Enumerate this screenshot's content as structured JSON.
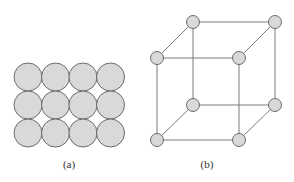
{
  "figure_a": {
    "label": "(a)",
    "label_pos": [
      69,
      168
    ],
    "grid": {
      "cols": 4,
      "rows": 3,
      "x0": 28,
      "y0": 77,
      "dx": 27.5,
      "dy": 28,
      "r": 14
    },
    "fill": "#d9d9d9",
    "stroke": "#6b6b6b"
  },
  "figure_b": {
    "label": "(b)",
    "label_pos": [
      207,
      168
    ],
    "nodes": [
      {
        "id": "top-back-left",
        "x": 193,
        "y": 22
      },
      {
        "id": "top-back-right",
        "x": 275,
        "y": 22
      },
      {
        "id": "top-front-left",
        "x": 157,
        "y": 58
      },
      {
        "id": "top-front-right",
        "x": 239,
        "y": 58
      },
      {
        "id": "bottom-back-left",
        "x": 193,
        "y": 105
      },
      {
        "id": "bottom-back-right",
        "x": 275,
        "y": 105
      },
      {
        "id": "bottom-front-left",
        "x": 157,
        "y": 140
      },
      {
        "id": "bottom-front-right",
        "x": 239,
        "y": 140
      }
    ],
    "edges": [
      [
        0,
        1
      ],
      [
        2,
        3
      ],
      [
        0,
        2
      ],
      [
        1,
        3
      ],
      [
        4,
        5
      ],
      [
        6,
        7
      ],
      [
        4,
        6
      ],
      [
        5,
        7
      ],
      [
        0,
        4
      ],
      [
        1,
        5
      ],
      [
        2,
        6
      ],
      [
        3,
        7
      ]
    ],
    "node_r": 6.5,
    "node_fill": "#d9d9d9",
    "node_stroke": "#6b6b6b",
    "edge_stroke": "#7a7a7a"
  }
}
